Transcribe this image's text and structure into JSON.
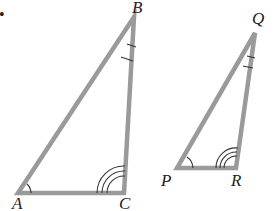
{
  "diagram": {
    "type": "similar-triangles",
    "bullet": "•",
    "colors": {
      "edge": "#9a9a9a",
      "mark": "#333333",
      "label": "#222222",
      "background": "#ffffff"
    },
    "triangles": [
      {
        "name": "ABC",
        "vertices": [
          {
            "label": "A",
            "angle_marks": 1
          },
          {
            "label": "B",
            "angle_marks": 1,
            "mark_style": "tick"
          },
          {
            "label": "C",
            "angle_marks": 3
          }
        ]
      },
      {
        "name": "PQR",
        "vertices": [
          {
            "label": "P",
            "angle_marks": 1
          },
          {
            "label": "Q",
            "angle_marks": 1,
            "mark_style": "tick"
          },
          {
            "label": "R",
            "angle_marks": 3
          }
        ]
      }
    ]
  }
}
